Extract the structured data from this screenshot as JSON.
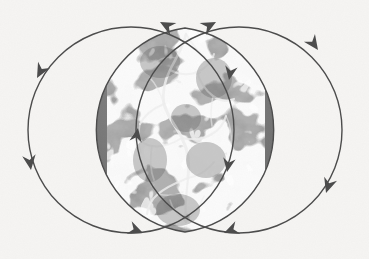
{
  "figure": {
    "alt_label": "vesica-piscis-flow-diagram",
    "background_color": "#f6f5f3",
    "stroke_color": "#4a4a4a",
    "stroke_width": 1.4,
    "lens_fill_base": "#7b7b7b",
    "lens_vein_color": "#ececec",
    "lens_shadow_color": "#5d5d5d",
    "canvas": {
      "width": 369,
      "height": 259
    }
  },
  "circles": [
    {
      "id": "left-circle",
      "label": "Left circle",
      "cx": 131,
      "cy": 130,
      "r": 103,
      "flow": "counterclockwise"
    },
    {
      "id": "right-circle",
      "label": "Right circle",
      "cx": 239,
      "cy": 130,
      "r": 103,
      "flow": "clockwise"
    }
  ],
  "intersection": {
    "id": "vesica-lens",
    "label": "Vesica piscis intersection",
    "top_vertex": {
      "x": 185,
      "y": 28
    },
    "bottom_vertex": {
      "x": 185,
      "y": 232
    },
    "half_width": 49,
    "texture": "marbled-cracked-gray"
  },
  "arrows": [
    {
      "id": "arrow-top-left",
      "label": "Top left arrowhead",
      "x": 160,
      "y": 22,
      "angle": -152,
      "belongs_to": "left-circle",
      "size": 13
    },
    {
      "id": "arrow-top-right",
      "label": "Top right arrowhead",
      "x": 216,
      "y": 22,
      "angle": -28,
      "belongs_to": "right-circle",
      "size": 13
    },
    {
      "id": "arrow-upper-left",
      "label": "Upper left arrowhead",
      "x": 37,
      "y": 78,
      "angle": 118,
      "belongs_to": "left-circle",
      "size": 13
    },
    {
      "id": "arrow-upper-right",
      "label": "Upper right arrowhead",
      "x": 318,
      "y": 50,
      "angle": 55,
      "belongs_to": "right-circle",
      "size": 13
    },
    {
      "id": "arrow-lower-left",
      "label": "Lower left arrowhead",
      "x": 31,
      "y": 170,
      "angle": 82,
      "belongs_to": "left-circle",
      "size": 13
    },
    {
      "id": "arrow-lower-right",
      "label": "Lower right arrowhead",
      "x": 326,
      "y": 193,
      "angle": 108,
      "belongs_to": "right-circle",
      "size": 13
    },
    {
      "id": "arrow-bottom-left",
      "label": "Bottom left arrowhead",
      "x": 143,
      "y": 233,
      "angle": 22,
      "belongs_to": "left-circle",
      "size": 13
    },
    {
      "id": "arrow-bottom-right",
      "label": "Bottom right arrowhead",
      "x": 224,
      "y": 233,
      "angle": 158,
      "belongs_to": "right-circle",
      "size": 13
    },
    {
      "id": "arrow-lens-left",
      "label": "Left lens edge arrowhead",
      "x": 138,
      "y": 128,
      "angle": -80,
      "belongs_to": "right-circle",
      "size": 12
    },
    {
      "id": "arrow-lens-right-upper",
      "label": "Right lens edge upper arrowhead",
      "x": 229,
      "y": 80,
      "angle": 100,
      "belongs_to": "left-circle",
      "size": 12
    },
    {
      "id": "arrow-lens-right-lower",
      "label": "Right lens edge lower arrowhead",
      "x": 227,
      "y": 172,
      "angle": 100,
      "belongs_to": "left-circle",
      "size": 12
    }
  ]
}
